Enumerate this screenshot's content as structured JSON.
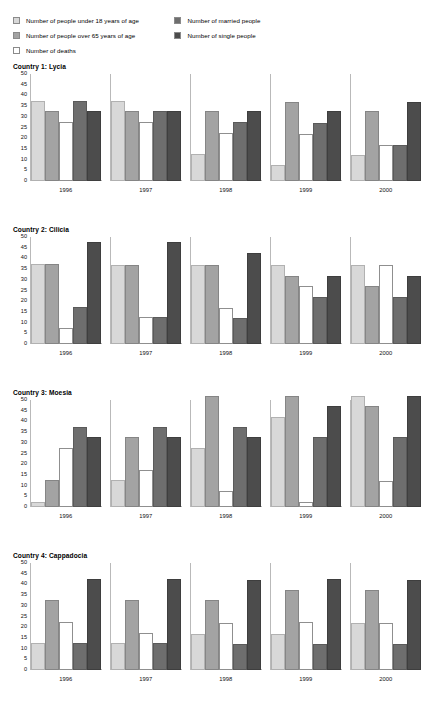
{
  "legend": {
    "left_column": [
      {
        "label": "Number of people under 18 years of age",
        "color": "#d8d8d8",
        "key": "under18"
      },
      {
        "label": "Number of people over 65 years of age",
        "color": "#a3a3a3",
        "key": "over65"
      },
      {
        "label": "Number of deaths",
        "color": "#ffffff",
        "key": "deaths"
      }
    ],
    "right_column": [
      {
        "label": "Number of married people",
        "color": "#6e6e6e",
        "key": "married"
      },
      {
        "label": "Number of single people",
        "color": "#4c4c4c",
        "key": "single"
      }
    ]
  },
  "axis": {
    "ticks": [
      50,
      45,
      40,
      35,
      30,
      25,
      20,
      15,
      10,
      5,
      0
    ],
    "min": 0,
    "max": 50
  },
  "charts": [
    {
      "title": "Country 1: Lycia",
      "categories": [
        "1996",
        "1997",
        "1998",
        "1999",
        "2000"
      ]
    },
    {
      "title": "Country 2: Cilicia",
      "categories": [
        "1996",
        "1997",
        "1998",
        "1999",
        "2000"
      ]
    },
    {
      "title": "Country 3: Moesia",
      "categories": [
        "1996",
        "1997",
        "1998",
        "1999",
        "2000"
      ]
    },
    {
      "title": "Country 4: Cappadocia",
      "categories": [
        "1996",
        "1997",
        "1998",
        "1999",
        "2000"
      ]
    }
  ],
  "chart_data": [
    {
      "type": "bar",
      "title": "Country 1: Lycia",
      "xlabel": "",
      "ylabel": "",
      "ylim": [
        0,
        50
      ],
      "yticks": [
        0,
        5,
        10,
        15,
        20,
        25,
        30,
        35,
        40,
        45,
        50
      ],
      "grid": false,
      "legend_position": "top",
      "categories": [
        "1996",
        "1997",
        "1998",
        "1999",
        "2000"
      ],
      "series": [
        {
          "name": "Number of people under 18 years of age",
          "color": "#d8d8d8",
          "values": [
            37.5,
            37.5,
            12.5,
            7.5,
            12
          ]
        },
        {
          "name": "Number of people over 65 years of age",
          "color": "#a3a3a3",
          "values": [
            32.5,
            32.5,
            32.5,
            37,
            32.5
          ]
        },
        {
          "name": "Number of deaths",
          "color": "#ffffff",
          "values": [
            27.5,
            27.5,
            22.5,
            22,
            17
          ]
        },
        {
          "name": "Number of married people",
          "color": "#6e6e6e",
          "values": [
            37.5,
            32.5,
            27.5,
            27,
            17
          ]
        },
        {
          "name": "Number of single people",
          "color": "#4c4c4c",
          "values": [
            32.5,
            32.5,
            32.5,
            32.5,
            37
          ]
        }
      ]
    },
    {
      "type": "bar",
      "title": "Country 2: Cilicia",
      "xlabel": "",
      "ylabel": "",
      "ylim": [
        0,
        50
      ],
      "yticks": [
        0,
        5,
        10,
        15,
        20,
        25,
        30,
        35,
        40,
        45,
        50
      ],
      "grid": false,
      "legend_position": "top",
      "categories": [
        "1996",
        "1997",
        "1998",
        "1999",
        "2000"
      ],
      "series": [
        {
          "name": "Number of people under 18 years of age",
          "color": "#d8d8d8",
          "values": [
            37.5,
            37,
            37,
            37,
            37
          ]
        },
        {
          "name": "Number of people over 65 years of age",
          "color": "#a3a3a3",
          "values": [
            37.5,
            37,
            37,
            32,
            27
          ]
        },
        {
          "name": "Number of deaths",
          "color": "#ffffff",
          "values": [
            7.5,
            12.5,
            17,
            27,
            37
          ]
        },
        {
          "name": "Number of married people",
          "color": "#6e6e6e",
          "values": [
            17.5,
            12.5,
            12,
            22,
            22
          ]
        },
        {
          "name": "Number of single people",
          "color": "#4c4c4c",
          "values": [
            47.5,
            47.5,
            42.5,
            32,
            32
          ]
        }
      ]
    },
    {
      "type": "bar",
      "title": "Country 3: Moesia",
      "xlabel": "",
      "ylabel": "",
      "ylim": [
        0,
        50
      ],
      "yticks": [
        0,
        5,
        10,
        15,
        20,
        25,
        30,
        35,
        40,
        45,
        50
      ],
      "grid": false,
      "legend_position": "top",
      "categories": [
        "1996",
        "1997",
        "1998",
        "1999",
        "2000"
      ],
      "series": [
        {
          "name": "Number of people under 18 years of age",
          "color": "#d8d8d8",
          "values": [
            2.5,
            12.5,
            27.5,
            42,
            52
          ]
        },
        {
          "name": "Number of people over 65 years of age",
          "color": "#a3a3a3",
          "values": [
            12.5,
            32.5,
            52,
            52,
            47
          ]
        },
        {
          "name": "Number of deaths",
          "color": "#ffffff",
          "values": [
            27.5,
            17.5,
            7.5,
            2.5,
            12
          ]
        },
        {
          "name": "Number of married people",
          "color": "#6e6e6e",
          "values": [
            37.5,
            37.5,
            37.5,
            32.5,
            32.5
          ]
        },
        {
          "name": "Number of single people",
          "color": "#4c4c4c",
          "values": [
            32.5,
            32.5,
            32.5,
            47,
            52
          ]
        }
      ]
    },
    {
      "type": "bar",
      "title": "Country 4: Cappadocia",
      "xlabel": "",
      "ylabel": "",
      "ylim": [
        0,
        50
      ],
      "yticks": [
        0,
        5,
        10,
        15,
        20,
        25,
        30,
        35,
        40,
        45,
        50
      ],
      "grid": false,
      "legend_position": "top",
      "categories": [
        "1996",
        "1997",
        "1998",
        "1999",
        "2000"
      ],
      "series": [
        {
          "name": "Number of people under 18 years of age",
          "color": "#d8d8d8",
          "values": [
            12.5,
            12.5,
            17,
            17,
            22
          ]
        },
        {
          "name": "Number of people over 65 years of age",
          "color": "#a3a3a3",
          "values": [
            32.5,
            32.5,
            32.5,
            37.5,
            37.5
          ]
        },
        {
          "name": "Number of deaths",
          "color": "#ffffff",
          "values": [
            22.5,
            17.5,
            22,
            22.5,
            22
          ]
        },
        {
          "name": "Number of married people",
          "color": "#6e6e6e",
          "values": [
            12.5,
            12.5,
            12,
            12,
            12
          ]
        },
        {
          "name": "Number of single people",
          "color": "#4c4c4c",
          "values": [
            42.5,
            42.5,
            42,
            42.5,
            42
          ]
        }
      ]
    }
  ]
}
